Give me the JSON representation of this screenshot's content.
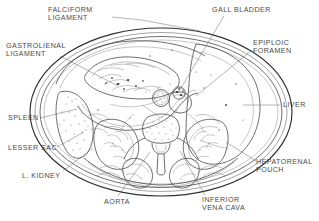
{
  "figure": {
    "type": "anatomical-cross-section",
    "background_color": "#ffffff",
    "ink_color": "#4a4a4a",
    "width": 319,
    "height": 221
  },
  "labels": [
    {
      "id": "falciform-ligament",
      "text": "FALCIFORM\nLIGAMENT",
      "x": 48,
      "y": 6,
      "align": "left",
      "leader": "M 112 17 L 142 20 L 200 31"
    },
    {
      "id": "gall-bladder",
      "text": "GALL BLADDER",
      "x": 212,
      "y": 6,
      "align": "left",
      "leader": "M 224 16 L 178 93"
    },
    {
      "id": "gastrolienal-ligament",
      "text": "GASTROLIENAL\nLIGAMENT",
      "x": 6,
      "y": 42,
      "align": "left",
      "leader": "M 60 56 L 118 86"
    },
    {
      "id": "epiploic-foramen",
      "text": "EPIPLOIC\nFORAMEN",
      "x": 253,
      "y": 39,
      "align": "left",
      "leader": "M 252 50 L 196 96"
    },
    {
      "id": "liver",
      "text": "LIVER",
      "x": 283,
      "y": 101,
      "align": "left",
      "leader": "M 281 105 L 243 105"
    },
    {
      "id": "spleen",
      "text": "SPLEEN",
      "x": 8,
      "y": 114,
      "align": "left",
      "leader": "M 40 118 L 77 109"
    },
    {
      "id": "lesser-sac",
      "text": "LESSER SAC",
      "x": 8,
      "y": 144,
      "align": "left",
      "leader": "M 57 147 L 84 132"
    },
    {
      "id": "l-kidney",
      "text": "L. KIDNEY",
      "x": 22,
      "y": 172,
      "align": "left",
      "leader": "M 63 171 L 93 148"
    },
    {
      "id": "hepatorenal-pouch",
      "text": "HEPATORENAL\nPOUCH",
      "x": 256,
      "y": 158,
      "align": "left",
      "leader": "M 256 161 L 226 142"
    },
    {
      "id": "aorta",
      "text": "AORTA",
      "x": 104,
      "y": 198,
      "align": "left",
      "leader": "M 118 196 L 150 152"
    },
    {
      "id": "inferior-vena-cava",
      "text": "INFERIOR\nVENA CAVA",
      "x": 202,
      "y": 196,
      "align": "left",
      "leader": "M 205 195 L 180 151"
    }
  ],
  "structures": [
    {
      "id": "body-wall",
      "name": "abdominal body wall"
    },
    {
      "id": "liver-region",
      "name": "liver"
    },
    {
      "id": "stomach",
      "name": "stomach with rugae"
    },
    {
      "id": "spleen-organ",
      "name": "spleen"
    },
    {
      "id": "left-kidney",
      "name": "left kidney"
    },
    {
      "id": "right-kidney",
      "name": "right kidney"
    },
    {
      "id": "vertebra",
      "name": "lumbar vertebra"
    },
    {
      "id": "aorta-vessel",
      "name": "aorta"
    },
    {
      "id": "ivc-vessel",
      "name": "inferior vena cava"
    },
    {
      "id": "gall-bladder-organ",
      "name": "gall bladder"
    },
    {
      "id": "paraspinal-muscles",
      "name": "paraspinal muscles"
    },
    {
      "id": "greater-omentum",
      "name": "greater omentum"
    }
  ]
}
